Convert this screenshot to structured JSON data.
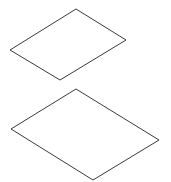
{
  "canvas": {
    "width": 171,
    "height": 182,
    "background": "#ffffff"
  },
  "style": {
    "stroke": "#3a3a3a",
    "stroke_width": 1,
    "fill": "#ffffff"
  },
  "shapes": [
    {
      "name": "top-parallelogram",
      "points": "76,9 126,40 60,80 10,50"
    },
    {
      "name": "bottom-parallelogram",
      "points": "76,89 159,140 93,180 11,129"
    }
  ]
}
